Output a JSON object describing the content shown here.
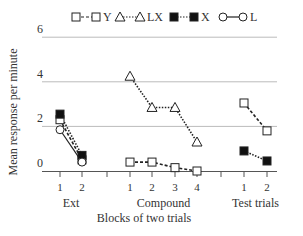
{
  "chart_data": {
    "type": "line",
    "title": "",
    "xlabel": "Blocks of two trials",
    "ylabel": "Mean response per minute",
    "ylim": [
      0,
      6
    ],
    "yticks": [
      0,
      2,
      4,
      6
    ],
    "grid": true,
    "legend_position": "top",
    "groups": [
      {
        "name": "Ext",
        "blocks": [
          "1",
          "2"
        ]
      },
      {
        "name": "Compound",
        "blocks": [
          "1",
          "2",
          "3",
          "4"
        ]
      },
      {
        "name": "Test trials",
        "blocks": [
          "1",
          "2"
        ]
      }
    ],
    "legend": [
      {
        "name": "Y",
        "marker": "open-square",
        "line": "dashed"
      },
      {
        "name": "LX",
        "marker": "open-triangle",
        "line": "dotted"
      },
      {
        "name": "X",
        "marker": "filled-square",
        "line": "dotted"
      },
      {
        "name": "L",
        "marker": "open-circle",
        "line": "solid"
      }
    ],
    "series": [
      {
        "name": "Y",
        "marker": "open-square",
        "line": "dashed",
        "segments": [
          {
            "group": "Ext",
            "x": [
              1,
              2
            ],
            "values": [
              2.3,
              0.5
            ]
          },
          {
            "group": "Compound",
            "x": [
              1,
              2,
              3,
              4
            ],
            "values": [
              0.4,
              0.4,
              0.15,
              0.0
            ]
          },
          {
            "group": "Test trials",
            "x": [
              1,
              2
            ],
            "values": [
              3.05,
              1.8
            ]
          }
        ]
      },
      {
        "name": "LX",
        "marker": "open-triangle",
        "line": "dotted",
        "segments": [
          {
            "group": "Compound",
            "x": [
              1,
              2,
              3,
              4
            ],
            "values": [
              4.25,
              2.85,
              2.85,
              1.3
            ]
          }
        ]
      },
      {
        "name": "X",
        "marker": "filled-square",
        "line": "dotted",
        "segments": [
          {
            "group": "Ext",
            "x": [
              1,
              2
            ],
            "values": [
              2.55,
              0.7
            ]
          },
          {
            "group": "Test trials",
            "x": [
              1,
              2
            ],
            "values": [
              0.9,
              0.45
            ]
          }
        ]
      },
      {
        "name": "L",
        "marker": "open-circle",
        "line": "solid",
        "segments": [
          {
            "group": "Ext",
            "x": [
              1,
              2
            ],
            "values": [
              1.85,
              0.4
            ]
          }
        ]
      }
    ]
  }
}
